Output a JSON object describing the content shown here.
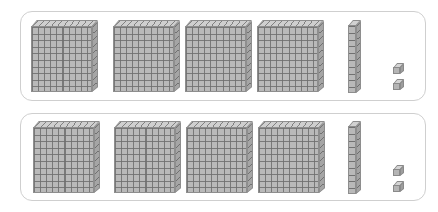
{
  "canvas": {
    "width": 438,
    "height": 212,
    "background_color": "#ffffff"
  },
  "manipulative": {
    "kind": "base-ten-blocks",
    "title": "Base-Ten Blocks",
    "tray_border_color": "#cfcfcf",
    "block_fill_color": "#b9b9b9",
    "block_line_color": "#6e6e6e",
    "block_outline_color": "#8e8e8e",
    "piece_names": {
      "hundred": "flat",
      "ten": "rod",
      "one": "unit"
    }
  },
  "trays": [
    {
      "id": "tray-0",
      "label": "Top tray",
      "x": 20,
      "y": 11,
      "width": 406,
      "height": 90,
      "counts": {
        "hundreds": 4,
        "tens": 1,
        "ones": 2
      },
      "value": 422,
      "flats": [
        {
          "label": "flat-1",
          "x": 30,
          "y": 19,
          "cells": 100
        },
        {
          "label": "flat-2",
          "x": 112,
          "y": 19,
          "cells": 100
        },
        {
          "label": "flat-3",
          "x": 184,
          "y": 19,
          "cells": 100
        },
        {
          "label": "flat-4",
          "x": 256,
          "y": 19,
          "cells": 100
        }
      ],
      "rods": [
        {
          "label": "rod-1",
          "x": 347,
          "y": 19,
          "segments": 10
        }
      ],
      "units": [
        {
          "label": "unit-1",
          "x": 392,
          "y": 62
        },
        {
          "label": "unit-2",
          "x": 392,
          "y": 78
        }
      ]
    },
    {
      "id": "tray-1",
      "label": "Bottom tray",
      "x": 20,
      "y": 113,
      "width": 406,
      "height": 88,
      "counts": {
        "hundreds": 4,
        "tens": 1,
        "ones": 2
      },
      "value": 422,
      "flats": [
        {
          "label": "flat-1",
          "x": 32,
          "y": 121,
          "cells": 100
        },
        {
          "label": "flat-2",
          "x": 113,
          "y": 121,
          "cells": 100
        },
        {
          "label": "flat-3",
          "x": 185,
          "y": 121,
          "cells": 100
        },
        {
          "label": "flat-4",
          "x": 257,
          "y": 121,
          "cells": 100
        }
      ],
      "rods": [
        {
          "label": "rod-1",
          "x": 347,
          "y": 121,
          "segments": 10
        }
      ],
      "units": [
        {
          "label": "unit-1",
          "x": 392,
          "y": 164
        },
        {
          "label": "unit-2",
          "x": 392,
          "y": 180
        }
      ]
    }
  ]
}
